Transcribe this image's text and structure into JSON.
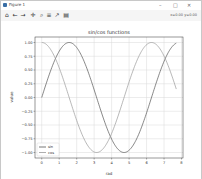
{
  "window": {
    "title": "Figure 1",
    "controls": {
      "minimize": "–",
      "maximize": "□",
      "close": "✕"
    }
  },
  "toolbar": {
    "buttons": [
      {
        "name": "home",
        "glyph": "⌂"
      },
      {
        "name": "back",
        "glyph": "←"
      },
      {
        "name": "forward",
        "glyph": "→"
      },
      {
        "name": "pan",
        "glyph": "✛"
      },
      {
        "name": "zoom",
        "glyph": "⌕"
      },
      {
        "name": "configure-subplots",
        "glyph": "≡"
      },
      {
        "name": "edit-axis",
        "glyph": "↗"
      },
      {
        "name": "save",
        "glyph": "▤"
      }
    ],
    "coords": "x=0.00 y=0.00"
  },
  "chart_data": {
    "type": "line",
    "title": "sin/cos functions",
    "xlabel": "rad",
    "ylabel": "value",
    "xlim": [
      -0.385,
      8.085
    ],
    "ylim": [
      -1.1,
      1.1
    ],
    "x_range": [
      0,
      7.7
    ],
    "xticks": [
      "0",
      "1",
      "2",
      "3",
      "4",
      "5",
      "6",
      "7",
      "8"
    ],
    "yticks": [
      "1.00",
      "0.75",
      "0.50",
      "0.25",
      "0.00",
      "−0.25",
      "−0.50",
      "−0.75",
      "−1.00"
    ],
    "ytick_values": [
      1,
      0.75,
      0.5,
      0.25,
      0,
      -0.25,
      -0.5,
      -0.75,
      -1
    ],
    "grid": true,
    "legend_position": "lower-left",
    "series": [
      {
        "name": "sin",
        "function": "sin",
        "color": "#555555"
      },
      {
        "name": "cos",
        "function": "cos",
        "color": "#999999"
      }
    ]
  }
}
